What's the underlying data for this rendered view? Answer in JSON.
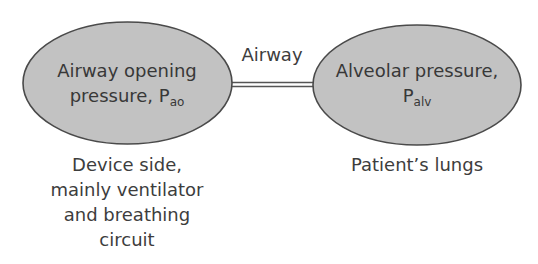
{
  "colors": {
    "ellipse_fill": "#c2c2c2",
    "ellipse_stroke": "#4a4a4a",
    "connector": "#555555",
    "text": "#3a3a3a",
    "background": "#ffffff"
  },
  "nodes": [
    {
      "id": "airway-opening",
      "line1": "Airway opening",
      "line2_prefix": "pressure, P",
      "line2_sub": "ao",
      "caption": [
        "Device side,",
        "mainly ventilator",
        "and breathing",
        "circuit"
      ]
    },
    {
      "id": "alveolar",
      "line1": "Alveolar pressure,",
      "line2_prefix": "P",
      "line2_sub": "alv",
      "caption": [
        "Patient’s lungs"
      ]
    }
  ],
  "connector": {
    "label": "Airway",
    "style": "double-line"
  }
}
